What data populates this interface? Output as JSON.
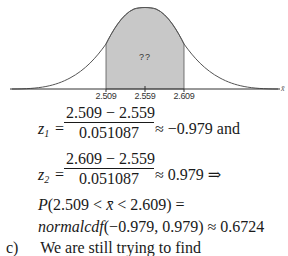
{
  "figure": {
    "type": "normal-distribution-shaded",
    "region_label": "??",
    "axis_variable": "x̄",
    "ticks": [
      {
        "label": "2.509",
        "x": 106
      },
      {
        "label": "2.559",
        "x": 145
      },
      {
        "label": "2.609",
        "x": 184
      }
    ],
    "shade_color": "#c8c8c8",
    "curve_color": "#555555"
  },
  "equations": {
    "z1": {
      "lhs_var": "z",
      "lhs_sub": "1",
      "numerator": "2.509 − 2.559",
      "denominator": "0.051087",
      "rhs": "≈ −0.979 and"
    },
    "z2": {
      "lhs_var": "z",
      "lhs_sub": "2",
      "numerator": "2.609 − 2.559",
      "denominator": "0.051087",
      "rhs": "≈ 0.979 ⇒"
    },
    "prob_line": {
      "P": "P",
      "expr_open": "(2.509 < ",
      "xbar": "x̄",
      "expr_close": " < 2.609) ="
    },
    "cdf_line": {
      "fn": "normalcdf",
      "args": "(−0.979, 0.979) ≈ 0.6724"
    }
  },
  "next_part": {
    "label": "c)",
    "text": "We are still trying to find"
  }
}
